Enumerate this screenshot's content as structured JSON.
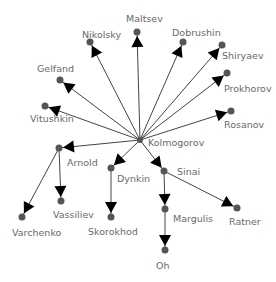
{
  "diagram": {
    "type": "tree-graph",
    "root": "Kolmogorov",
    "colors": {
      "edge": "#444444",
      "node": "#555555",
      "arrow": "#000000",
      "label": "#6a6a6a"
    },
    "nodes": [
      {
        "id": "Kolmogorov",
        "label": "Kolmogorov",
        "x": 140,
        "y": 140,
        "lx": 148,
        "ly": 138
      },
      {
        "id": "Maltsev",
        "label": "Maltsev",
        "x": 137,
        "y": 32,
        "lx": 126,
        "ly": 14
      },
      {
        "id": "Nikolsky",
        "label": "Nikolsky",
        "x": 90,
        "y": 42,
        "lx": 82,
        "ly": 30
      },
      {
        "id": "Dobrushin",
        "label": "Dobrushin",
        "x": 183,
        "y": 42,
        "lx": 172,
        "ly": 28
      },
      {
        "id": "Shiryaev",
        "label": "Shiryaev",
        "x": 222,
        "y": 45,
        "lx": 222,
        "ly": 51
      },
      {
        "id": "Gelfand",
        "label": "Gelfand",
        "x": 60,
        "y": 80,
        "lx": 37,
        "ly": 64
      },
      {
        "id": "Prokhorov",
        "label": "Prokhorov",
        "x": 227,
        "y": 73,
        "lx": 224,
        "ly": 84
      },
      {
        "id": "Vitushkin",
        "label": "Vitushkin",
        "x": 45,
        "y": 106,
        "lx": 30,
        "ly": 114
      },
      {
        "id": "Rosanov",
        "label": "Rosanov",
        "x": 231,
        "y": 111,
        "lx": 224,
        "ly": 120
      },
      {
        "id": "Arnold",
        "label": "Arnold",
        "x": 59,
        "y": 148,
        "lx": 67,
        "ly": 158
      },
      {
        "id": "Dynkin",
        "label": "Dynkin",
        "x": 111,
        "y": 168,
        "lx": 117,
        "ly": 174
      },
      {
        "id": "Sinai",
        "label": "Sinai",
        "x": 164,
        "y": 171,
        "lx": 177,
        "ly": 167
      },
      {
        "id": "Vassiliev",
        "label": "Vassiliev",
        "x": 61,
        "y": 201,
        "lx": 53,
        "ly": 210
      },
      {
        "id": "Varchenko",
        "label": "Varchenko",
        "x": 22,
        "y": 217,
        "lx": 12,
        "ly": 228
      },
      {
        "id": "Skorokhod",
        "label": "Skorokhod",
        "x": 111,
        "y": 217,
        "lx": 88,
        "ly": 227
      },
      {
        "id": "Margulis",
        "label": "Margulis",
        "x": 165,
        "y": 209,
        "lx": 173,
        "ly": 214
      },
      {
        "id": "Ratner",
        "label": "Ratner",
        "x": 237,
        "y": 208,
        "lx": 229,
        "ly": 217
      },
      {
        "id": "Oh",
        "label": "Oh",
        "x": 165,
        "y": 250,
        "lx": 156,
        "ly": 261
      }
    ],
    "edges": [
      {
        "from": "Kolmogorov",
        "to": "Maltsev"
      },
      {
        "from": "Kolmogorov",
        "to": "Nikolsky"
      },
      {
        "from": "Kolmogorov",
        "to": "Dobrushin"
      },
      {
        "from": "Kolmogorov",
        "to": "Shiryaev"
      },
      {
        "from": "Kolmogorov",
        "to": "Gelfand"
      },
      {
        "from": "Kolmogorov",
        "to": "Prokhorov"
      },
      {
        "from": "Kolmogorov",
        "to": "Vitushkin"
      },
      {
        "from": "Kolmogorov",
        "to": "Rosanov"
      },
      {
        "from": "Kolmogorov",
        "to": "Arnold"
      },
      {
        "from": "Kolmogorov",
        "to": "Dynkin"
      },
      {
        "from": "Kolmogorov",
        "to": "Sinai"
      },
      {
        "from": "Arnold",
        "to": "Vassiliev"
      },
      {
        "from": "Arnold",
        "to": "Varchenko"
      },
      {
        "from": "Dynkin",
        "to": "Skorokhod"
      },
      {
        "from": "Sinai",
        "to": "Margulis"
      },
      {
        "from": "Sinai",
        "to": "Ratner"
      },
      {
        "from": "Margulis",
        "to": "Oh"
      }
    ]
  }
}
